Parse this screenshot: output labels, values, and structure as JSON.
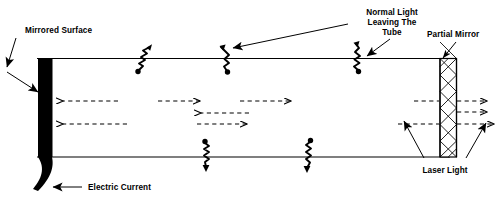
{
  "figure": {
    "title_text": "Laser tube cross-section diagram",
    "background_color": "#ffffff",
    "ink_color": "#000000"
  },
  "labels": {
    "mirrored_surface": "Mirrored Surface",
    "normal_light_line1": "Normal Light",
    "normal_light_line2": "Leaving The",
    "normal_light_line3": "Tube",
    "partial_mirror": "Partial Mirror",
    "electric_current": "Electric Current",
    "laser_light": "Laser Light"
  },
  "components": {
    "tube": {
      "name": "laser-tube",
      "x": 37,
      "y": 58,
      "width": 413,
      "height": 100
    },
    "full_mirror": {
      "name": "mirrored-surface-block",
      "fill": "#000000",
      "x": 38,
      "y": 58,
      "width": 14,
      "height": 98
    },
    "partial_mirror": {
      "name": "partial-mirror-block",
      "pattern": "cross-hatch",
      "x": 440,
      "y": 59,
      "width": 16,
      "height": 98
    },
    "electric_current_wire": {
      "name": "electric-current-wire",
      "shape": "curved-tapered-wedge"
    }
  },
  "photons": [
    {
      "name": "photon-emission-top-1",
      "position": "top-wall",
      "x": 150,
      "direction": "up-right"
    },
    {
      "name": "photon-emission-top-2",
      "position": "top-wall",
      "x": 228,
      "direction": "up"
    },
    {
      "name": "photon-emission-top-3",
      "position": "top-wall",
      "x": 358,
      "direction": "up"
    },
    {
      "name": "photon-emission-bottom-1",
      "position": "bottom-wall",
      "x": 205,
      "direction": "down"
    },
    {
      "name": "photon-emission-bottom-2",
      "position": "bottom-wall",
      "x": 308,
      "direction": "down"
    }
  ],
  "rays": [
    {
      "name": "ray-left-1",
      "direction": "left",
      "x1": 118,
      "x2": 62,
      "y": 101
    },
    {
      "name": "ray-right-1",
      "direction": "right",
      "x1": 158,
      "x2": 200,
      "y": 101
    },
    {
      "name": "ray-right-2",
      "direction": "right",
      "x1": 240,
      "x2": 291,
      "y": 101
    },
    {
      "name": "ray-left-2",
      "direction": "left",
      "x1": 248,
      "x2": 200,
      "y": 113
    },
    {
      "name": "ray-left-3",
      "direction": "left",
      "x1": 127,
      "x2": 62,
      "y": 124
    },
    {
      "name": "ray-right-3",
      "direction": "right",
      "x1": 197,
      "x2": 247,
      "y": 124
    },
    {
      "name": "ray-to-mirror-upper",
      "direction": "right",
      "x1": 414,
      "x2": 440,
      "y": 101
    },
    {
      "name": "ray-exit-upper",
      "direction": "right",
      "x1": 456,
      "x2": 487,
      "y": 101
    },
    {
      "name": "ray-exit-middle",
      "direction": "right",
      "x1": 456,
      "x2": 487,
      "y": 113
    },
    {
      "name": "ray-to-mirror-lower",
      "direction": "right",
      "x1": 398,
      "x2": 440,
      "y": 124
    },
    {
      "name": "ray-exit-lower",
      "direction": "right",
      "x1": 456,
      "x2": 495,
      "y": 124
    }
  ],
  "annotations": [
    {
      "name": "leader-mirrored-surface",
      "label": "Mirrored Surface",
      "points": "18,40 8,72 40,90"
    },
    {
      "name": "leader-normal-light",
      "label": "Normal Light Leaving The Tube",
      "points": "350,24 225,52"
    },
    {
      "name": "leader-normal-light-2",
      "label": "Normal Light Leaving The Tube",
      "points": "388,38 363,58"
    },
    {
      "name": "leader-partial-mirror",
      "label": "Partial Mirror",
      "points": "455,40 442,58"
    },
    {
      "name": "leader-electric-current",
      "label": "Electric Current",
      "points": "70,188 48,182"
    },
    {
      "name": "leader-laser-light-1",
      "label": "Laser Light",
      "points": "423,160 404,122"
    },
    {
      "name": "leader-laser-light-2",
      "label": "Laser Light",
      "points": "468,160 487,124"
    }
  ]
}
